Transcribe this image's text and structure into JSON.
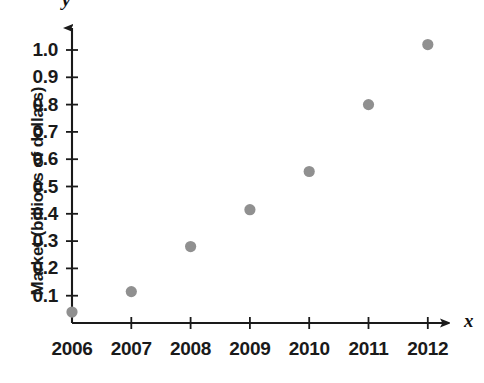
{
  "chart_data": {
    "type": "scatter",
    "title": "",
    "xlabel": "x",
    "ylabel": "Market (billions of dollars)",
    "y_axis_symbol": "y",
    "x_axis_symbol": "x",
    "categories": [
      "2006",
      "2007",
      "2008",
      "2009",
      "2010",
      "2011",
      "2012"
    ],
    "x": [
      2006,
      2007,
      2008,
      2009,
      2010,
      2011,
      2012
    ],
    "values": [
      0.04,
      0.115,
      0.28,
      0.415,
      0.555,
      0.8,
      1.02
    ],
    "points": [
      {
        "label": "2006",
        "x": 2006,
        "y": 0.04
      },
      {
        "label": "2007",
        "x": 2007,
        "y": 0.115
      },
      {
        "label": "2008",
        "x": 2008,
        "y": 0.28
      },
      {
        "label": "2009",
        "x": 2009,
        "y": 0.415
      },
      {
        "label": "2010",
        "x": 2010,
        "y": 0.555
      },
      {
        "label": "2011",
        "x": 2011,
        "y": 0.8
      },
      {
        "label": "2012",
        "x": 2012,
        "y": 1.02
      }
    ],
    "xlim": [
      2006,
      2012
    ],
    "ylim": [
      0,
      1.05
    ],
    "y_ticks": [
      0.1,
      0.2,
      0.3,
      0.4,
      0.5,
      0.6,
      0.7,
      0.8,
      0.9,
      1.0
    ],
    "y_tick_labels": [
      "0.1",
      "0.2",
      "0.3",
      "0.4",
      "0.5",
      "0.6",
      "0.7",
      "0.8",
      "0.9",
      "1.0"
    ],
    "x_ticks": [
      2006,
      2007,
      2008,
      2009,
      2010,
      2011,
      2012
    ],
    "x_tick_labels": [
      "2006",
      "2007",
      "2008",
      "2009",
      "2010",
      "2011",
      "2012"
    ],
    "grid": false,
    "legend": "none",
    "marker_color": "#909090",
    "axis_color": "#1a1a1a",
    "background_color": "#ffffff"
  }
}
